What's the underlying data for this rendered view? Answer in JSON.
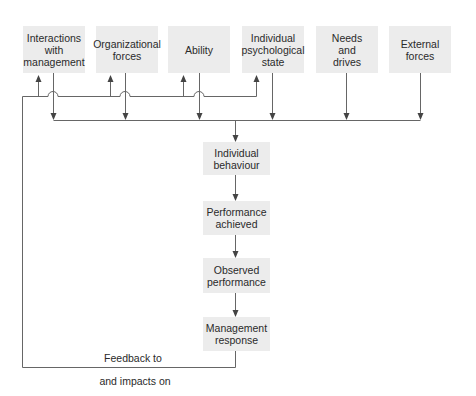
{
  "diagram": {
    "top_boxes": [
      {
        "id": "interactions",
        "label": "Interactions with management",
        "lines": [
          "Interactions",
          "with",
          "management"
        ]
      },
      {
        "id": "organizational",
        "label": "Organizational forces",
        "lines": [
          "Organizational",
          "forces"
        ]
      },
      {
        "id": "ability",
        "label": "Ability",
        "lines": [
          "Ability"
        ]
      },
      {
        "id": "psych",
        "label": "Individual psychological state",
        "lines": [
          "Individual",
          "psychological",
          "state"
        ]
      },
      {
        "id": "needs",
        "label": "Needs and drives",
        "lines": [
          "Needs",
          "and",
          "drives"
        ]
      },
      {
        "id": "external",
        "label": "External forces",
        "lines": [
          "External",
          "forces"
        ]
      }
    ],
    "chain_boxes": [
      {
        "id": "behaviour",
        "label": "Individual behaviour",
        "lines": [
          "Individual",
          "behaviour"
        ]
      },
      {
        "id": "performance",
        "label": "Performance achieved",
        "lines": [
          "Performance",
          "achieved"
        ]
      },
      {
        "id": "observed",
        "label": "Observed performance",
        "lines": [
          "Observed",
          "performance"
        ]
      },
      {
        "id": "response",
        "label": "Management response",
        "lines": [
          "Management",
          "response"
        ]
      }
    ],
    "feedback_label": {
      "line1": "Feedback to",
      "line2": "and impacts on"
    },
    "colors": {
      "box_fill": "#ececec",
      "line": "#555555",
      "text": "#2a2a2a"
    }
  }
}
